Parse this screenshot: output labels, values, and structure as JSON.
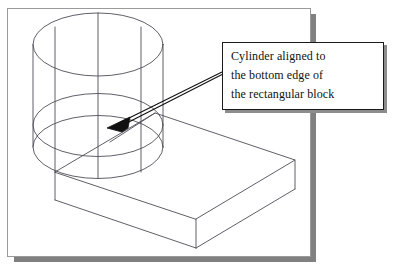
{
  "figure": {
    "type": "isometric-wireframe-technical-drawing",
    "page": {
      "background_color": "#ffffff",
      "border_color": "#9a9a9a",
      "shadow_color": "#808080"
    },
    "line_color": "#4d4d57",
    "annotation_line_color": "#111111"
  },
  "callout": {
    "lines": [
      "Cylinder aligned to",
      "the bottom edge of",
      "the rectangular block"
    ],
    "border_color": "#1a1a1a",
    "shadow_color": "#8c8c8c",
    "background_color": "#ffffff",
    "text_color": "#111111"
  },
  "leader": {
    "arrowhead": "solid-triangle",
    "points_at": "cylinder-bottom-edge-intersection",
    "color": "#111111"
  },
  "solids": {
    "cylinder": {
      "label": "cylinder",
      "visible_ellipses": 3,
      "silhouette_lines": 2
    },
    "block": {
      "label": "rectangular block",
      "faces_visible": [
        "top",
        "front",
        "right"
      ]
    }
  }
}
